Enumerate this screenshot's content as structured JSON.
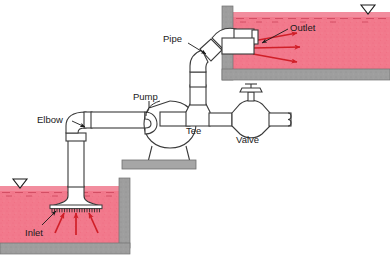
{
  "figure": {
    "width": 390,
    "height": 267
  },
  "labels": {
    "pipe": "Pipe",
    "outlet": "Outlet",
    "pump": "Pump",
    "tee": "Tee",
    "valve": "Valve",
    "elbow": "Elbow",
    "inlet": "Inlet"
  },
  "colors": {
    "water": "#f2798c",
    "water_dark": "#e8566e",
    "wall_gray": "#9a9a9a",
    "wall_gray_light": "#b8b8b8",
    "arrow_red": "#d01f28",
    "line": "#3a3a3a",
    "pipe_fill": "#ffffff",
    "text": "#1a1a1a",
    "base_gray": "#a6a6a6"
  },
  "components": [
    {
      "name": "inlet-bellmouth-strainer",
      "label": "Inlet"
    },
    {
      "name": "elbow",
      "label": "Elbow"
    },
    {
      "name": "pump",
      "label": "Pump"
    },
    {
      "name": "tee",
      "label": "Tee"
    },
    {
      "name": "valve",
      "label": "Valve"
    },
    {
      "name": "pipe",
      "label": "Pipe"
    },
    {
      "name": "outlet",
      "label": "Outlet"
    }
  ],
  "flow": {
    "inlet_arrow_count": 3,
    "outlet_arrow_count": 3,
    "inlet_arrow_direction": "up",
    "outlet_arrow_direction": "right"
  },
  "tanks": [
    {
      "name": "outlet-tank",
      "water_surface_symbol": "free-surface-triangle",
      "position": "upper-right"
    },
    {
      "name": "inlet-sump",
      "water_surface_symbol": "free-surface-triangle",
      "position": "lower-left"
    }
  ]
}
